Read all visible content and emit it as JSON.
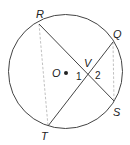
{
  "diagram": {
    "colors": {
      "stroke": "#444444",
      "dashed": "#b0b0b0",
      "text": "#222222",
      "background": "#ffffff"
    },
    "circle": {
      "center_label": "O",
      "cx": 65.5,
      "cy": 71.5,
      "r": 57
    },
    "points": {
      "R": {
        "label": "R",
        "x": 39,
        "y": 24
      },
      "Q": {
        "label": "Q",
        "x": 113,
        "y": 42
      },
      "S": {
        "label": "S",
        "x": 114,
        "y": 101
      },
      "T": {
        "label": "T",
        "x": 48,
        "y": 126
      },
      "V": {
        "label": "V",
        "x": 89,
        "y": 75
      },
      "O": {
        "label": "O",
        "x": 66,
        "y": 73
      }
    },
    "segments": [
      {
        "name": "chord-RS",
        "from": "R",
        "to": "S",
        "style": "solid"
      },
      {
        "name": "chord-QT",
        "from": "Q",
        "to": "T",
        "style": "solid"
      },
      {
        "name": "segment-RT",
        "from": "R",
        "to": "T",
        "style": "dashed"
      },
      {
        "name": "segment-QS",
        "from": "Q",
        "to": "S",
        "style": "dashed"
      }
    ],
    "angles": {
      "angle1": {
        "label": "1"
      },
      "angle2": {
        "label": "2"
      }
    }
  }
}
